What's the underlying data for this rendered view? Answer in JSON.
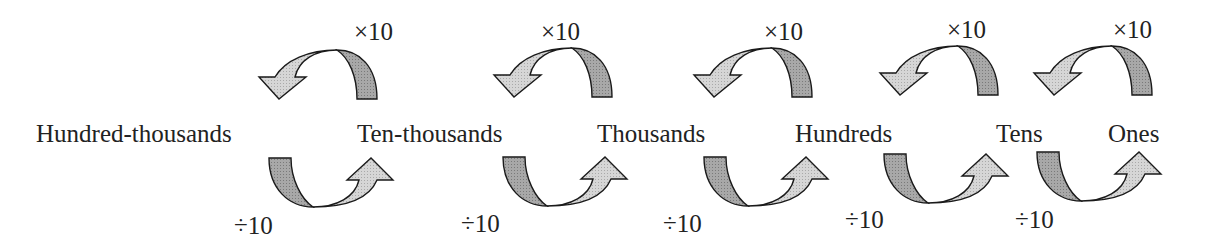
{
  "diagram": {
    "places": [
      {
        "label": "Hundred-thousands",
        "x": 36
      },
      {
        "label": "Ten-thousands",
        "x": 357
      },
      {
        "label": "Thousands",
        "x": 597
      },
      {
        "label": "Hundreds",
        "x": 795
      },
      {
        "label": "Tens",
        "x": 996
      },
      {
        "label": "Ones",
        "x": 1108
      }
    ],
    "multiply_label": "×10",
    "divide_label": "÷10",
    "multiply_arrows": [
      {
        "from": "Ten-thousands",
        "to": "Hundred-thousands",
        "label": "×10",
        "cx": 337,
        "label_x": 354,
        "label_y": 18
      },
      {
        "from": "Thousands",
        "to": "Ten-thousands",
        "label": "×10",
        "cx": 572,
        "label_x": 541,
        "label_y": 18
      },
      {
        "from": "Hundreds",
        "to": "Thousands",
        "label": "×10",
        "cx": 772,
        "label_x": 764,
        "label_y": 18
      },
      {
        "from": "Tens",
        "to": "Hundreds",
        "label": "×10",
        "cx": 958,
        "label_x": 947,
        "label_y": 16
      },
      {
        "from": "Ones",
        "to": "Tens",
        "label": "×10",
        "cx": 1112,
        "label_x": 1113,
        "label_y": 16
      }
    ],
    "divide_arrows": [
      {
        "from": "Hundred-thousands",
        "to": "Ten-thousands",
        "label": "÷10",
        "cx": 313,
        "label_x": 234,
        "label_y": 212
      },
      {
        "from": "Ten-thousands",
        "to": "Thousands",
        "label": "÷10",
        "cx": 547,
        "label_x": 461,
        "label_y": 210
      },
      {
        "from": "Thousands",
        "to": "Hundreds",
        "label": "÷10",
        "cx": 748,
        "label_x": 663,
        "label_y": 210
      },
      {
        "from": "Hundreds",
        "to": "Tens",
        "label": "÷10",
        "cx": 928,
        "label_x": 845,
        "label_y": 206
      },
      {
        "from": "Tens",
        "to": "Ones",
        "label": "÷10",
        "cx": 1081,
        "label_x": 1015,
        "label_y": 206
      }
    ],
    "colors": {
      "arrow_dark": "#9a9a9a",
      "arrow_light": "#cfcfcf",
      "outline": "#1a1a1a",
      "text": "#222222"
    }
  }
}
